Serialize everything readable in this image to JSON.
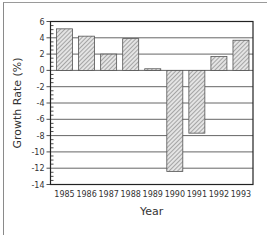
{
  "chart_data": {
    "type": "bar",
    "title": "",
    "xlabel": "Year",
    "ylabel": "Growth Rate (%)",
    "categories": [
      "1985",
      "1986",
      "1987",
      "1988",
      "1989",
      "1990",
      "1991",
      "1992",
      "1993"
    ],
    "values": [
      5.1,
      4.2,
      2.0,
      3.9,
      0.2,
      -12.4,
      -7.7,
      1.7,
      3.7
    ],
    "ylim": [
      -14,
      6
    ],
    "yticks": [
      6,
      4,
      2,
      0,
      -2,
      -4,
      -6,
      -8,
      -10,
      -12,
      -14
    ],
    "grid": true,
    "legend": null,
    "bar_fill": "hatched gray",
    "colors": {
      "bar_fill": "#c8c8c8",
      "bar_stroke": "#555555",
      "grid": "#555555",
      "axis": "#222222"
    }
  }
}
